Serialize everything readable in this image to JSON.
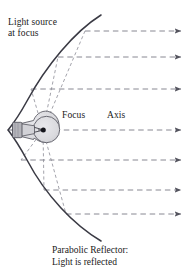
{
  "figure": {
    "labels": {
      "light_source_line1": "Light source",
      "light_source_line2": "at focus",
      "focus": "Focus",
      "axis": "Axis"
    },
    "caption": {
      "line1": "Parabolic Reflector:",
      "line2": "Light is reflected"
    },
    "colors": {
      "curve": "#3a3a44",
      "dashed_ray": "#7a7a85",
      "bulb_fill": "#d9d9dd",
      "bulb_stroke": "#55555e",
      "base_fill": "#b3b3b8",
      "focus_dot": "#1a1a1a",
      "background": "#ffffff",
      "text": "#1a1a1a"
    },
    "geometry": {
      "vertex": [
        8,
        130
      ],
      "focus_point": [
        43,
        130
      ],
      "curve_top_end": [
        101,
        15
      ],
      "curve_bottom_end": [
        101,
        241
      ],
      "axis_y": 130
    },
    "reflected_rays": [
      {
        "id": "ray-1",
        "y": 31,
        "curve_x": 85,
        "arrow_x": 181
      },
      {
        "id": "ray-2",
        "y": 57,
        "curve_x": 58,
        "arrow_x": 181
      },
      {
        "id": "ray-3",
        "y": 89,
        "curve_x": 31,
        "arrow_x": 181
      },
      {
        "id": "ray-4",
        "y": 130,
        "curve_x": 8,
        "arrow_x": 181
      },
      {
        "id": "ray-5",
        "y": 160,
        "curve_x": 21,
        "arrow_x": 181
      },
      {
        "id": "ray-6",
        "y": 190,
        "curve_x": 44,
        "arrow_x": 181
      },
      {
        "id": "ray-7",
        "y": 214,
        "curve_x": 66,
        "arrow_x": 181
      }
    ],
    "source_rays": [
      {
        "id": "source-ray-1",
        "to": [
          85,
          31
        ]
      },
      {
        "id": "source-ray-2",
        "to": [
          58,
          57
        ]
      },
      {
        "id": "source-ray-3",
        "to": [
          31,
          89
        ]
      },
      {
        "id": "source-ray-4",
        "to": [
          21,
          160
        ]
      },
      {
        "id": "source-ray-5",
        "to": [
          44,
          190
        ]
      },
      {
        "id": "source-ray-6",
        "to": [
          66,
          214
        ]
      }
    ]
  }
}
